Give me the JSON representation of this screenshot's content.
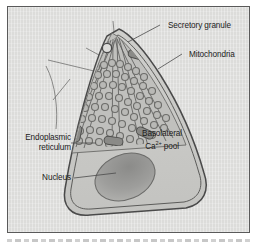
{
  "figure": {
    "style": "grayscale textbook line illustration",
    "frame_color": "#5a5a5a",
    "background_color": "#dcdcda",
    "cytoplasm_color": "#c9c9c6",
    "membrane_color": "#4a4a4a",
    "nucleus_color": "#9a9a98",
    "organelle_color": "#8d8d8a",
    "label_color": "#1b1b1b"
  },
  "labels": [
    {
      "id": "secretory-granule",
      "text": "Secretory granule",
      "position": "top-right",
      "x": 160,
      "y": 19,
      "align": "left"
    },
    {
      "id": "mitochondria",
      "text": "Mitochondria",
      "position": "right-upper",
      "x": 181,
      "y": 48,
      "align": "left"
    },
    {
      "id": "endoplasmic-reticulum",
      "line1": "Endoplasmic",
      "line2": "reticulum",
      "position": "left-middle",
      "x": 12,
      "y": 138,
      "align": "right"
    },
    {
      "id": "nucleus",
      "text": "Nucleus",
      "position": "left-lower",
      "x": 30,
      "y": 173,
      "align": "right"
    },
    {
      "id": "basolateral-ca-pool",
      "line1": "Basolateral",
      "ion_prefix": "Ca",
      "ion_charge": "2+",
      "ion_suffix": " pool",
      "position": "inside-cell-right",
      "x": 153,
      "y": 131,
      "align": "center"
    }
  ],
  "structures": [
    {
      "id": "plasma-membrane",
      "name": "plasma membrane",
      "description": "double outline of the teardrop-shaped cell"
    },
    {
      "id": "apical-notch",
      "name": "apical notch",
      "description": "small opening at cell apex where granule is released"
    },
    {
      "id": "granule-lobes",
      "name": "secretory granule lobes",
      "count": 5,
      "description": "radiating wedges packed with ring-shaped granules"
    },
    {
      "id": "er-strands",
      "name": "endoplasmic reticulum strands",
      "count": 5,
      "description": "paired lines radiating from apex between granule lobes"
    },
    {
      "id": "mitochondria-bodies",
      "name": "mitochondria",
      "count": 6,
      "description": "elongated dark capsules among the granules"
    },
    {
      "id": "nucleus-body",
      "name": "nucleus",
      "description": "large tilted oval in the basal cytoplasm"
    }
  ]
}
